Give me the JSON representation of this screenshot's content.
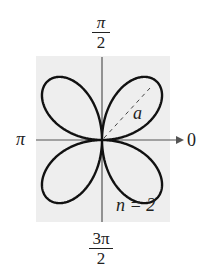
{
  "diagram": {
    "type": "polar rose curve",
    "background_color": "#eeeeee",
    "curve_color": "#111111",
    "axis_color": "#555555",
    "labels": {
      "top": {
        "num": "π",
        "den": "2"
      },
      "bottom": {
        "num": "3π",
        "den": "2"
      },
      "left": "π",
      "right": "0",
      "petal": "a",
      "parameter": "n = 2"
    },
    "petals": 4,
    "n": 2
  }
}
